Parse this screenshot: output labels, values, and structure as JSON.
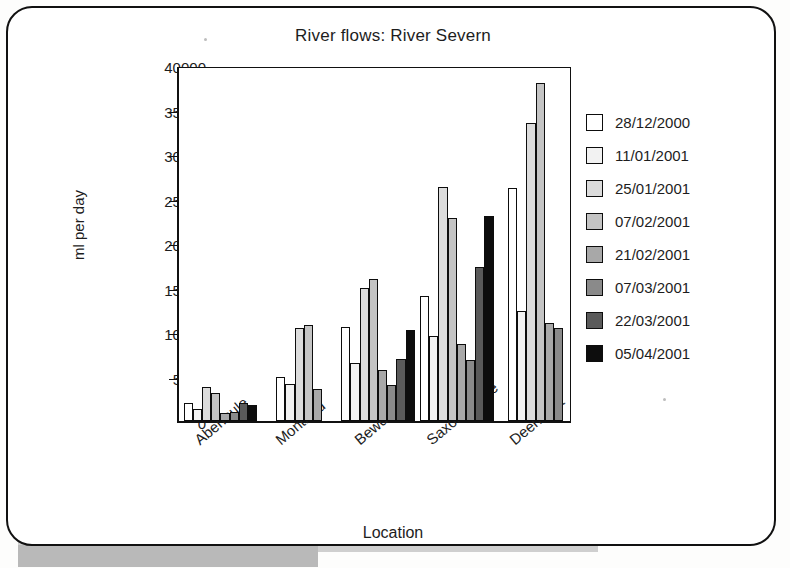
{
  "chart_data": {
    "type": "bar",
    "title": "River flows: River Severn",
    "xlabel": "Location",
    "ylabel": "ml per day",
    "ylim": [
      0,
      40000
    ],
    "ytick_labels": [
      "40000",
      "35000",
      "30000",
      "25000",
      "20000",
      "15000",
      "10000",
      "5000",
      "0"
    ],
    "ytick_values": [
      40000,
      35000,
      30000,
      25000,
      20000,
      15000,
      10000,
      5000,
      0
    ],
    "grid": false,
    "legend_position": "right",
    "categories": [
      "Abermule",
      "Montford",
      "Bewdley",
      "Saxons Lode",
      "Deerhurst"
    ],
    "series": [
      {
        "name": "28/12/2000",
        "color": "#ffffff",
        "values": [
          2000,
          5000,
          10600,
          14000,
          26200
        ]
      },
      {
        "name": "11/01/2001",
        "color": "#f2f2f2",
        "values": [
          1300,
          4200,
          6500,
          9600,
          12400
        ]
      },
      {
        "name": "25/01/2001",
        "color": "#dcdcdc",
        "values": [
          3800,
          10400,
          14900,
          26300,
          33500
        ]
      },
      {
        "name": "07/02/2001",
        "color": "#c4c4c4",
        "values": [
          3200,
          10800,
          16000,
          22800,
          38000
        ]
      },
      {
        "name": "21/02/2001",
        "color": "#a8a8a8",
        "values": [
          900,
          3600,
          5700,
          8600,
          11000
        ]
      },
      {
        "name": "07/03/2001",
        "color": "#8a8a8a",
        "values": [
          1000,
          null,
          4000,
          6800,
          10400
        ]
      },
      {
        "name": "22/03/2001",
        "color": "#5a5a5a",
        "values": [
          2000,
          null,
          7000,
          17300,
          null
        ]
      },
      {
        "name": "05/04/2001",
        "color": "#0d0d0d",
        "values": [
          1800,
          null,
          10200,
          23000,
          null
        ]
      }
    ]
  }
}
